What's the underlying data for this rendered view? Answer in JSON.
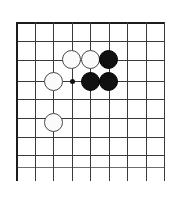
{
  "board": {
    "title": "go-board-diagram",
    "type": "go-board",
    "columns": 9,
    "rows": 9,
    "line_color": "#3a3a3a",
    "edge_color": "#1c1c1c",
    "background_color": "#ffffff",
    "black_stone_color": "#111111",
    "white_stone_color": "#fbfbfb",
    "white_stone_border_color": "#4a4a4a",
    "geometry": {
      "origin_x": 16,
      "origin_y": 22,
      "cell_size": 18.5,
      "stone_diameter": 19,
      "overhang_bottom": 14
    },
    "vertical_line_x": [
      16,
      34.5,
      53,
      71.5,
      90,
      108.5,
      127,
      145.5,
      164
    ],
    "horizontal_line_y": [
      22,
      40.5,
      59.5,
      81,
      99,
      118,
      136.5,
      155,
      167
    ],
    "star_points": [
      {
        "name": "star-point-center",
        "col": 3,
        "row": 3
      }
    ],
    "stones": [
      {
        "name": "white-stone-c3",
        "color": "white",
        "col": 3,
        "row": 2
      },
      {
        "name": "white-stone-d3",
        "color": "white",
        "col": 4,
        "row": 2
      },
      {
        "name": "black-stone-e3",
        "color": "black",
        "col": 5,
        "row": 2
      },
      {
        "name": "white-stone-b4",
        "color": "white",
        "col": 2,
        "row": 3
      },
      {
        "name": "black-stone-d4",
        "color": "black",
        "col": 4,
        "row": 3
      },
      {
        "name": "black-stone-e4",
        "color": "black",
        "col": 5,
        "row": 3
      },
      {
        "name": "white-stone-b6",
        "color": "white",
        "col": 2,
        "row": 5.25
      }
    ]
  }
}
